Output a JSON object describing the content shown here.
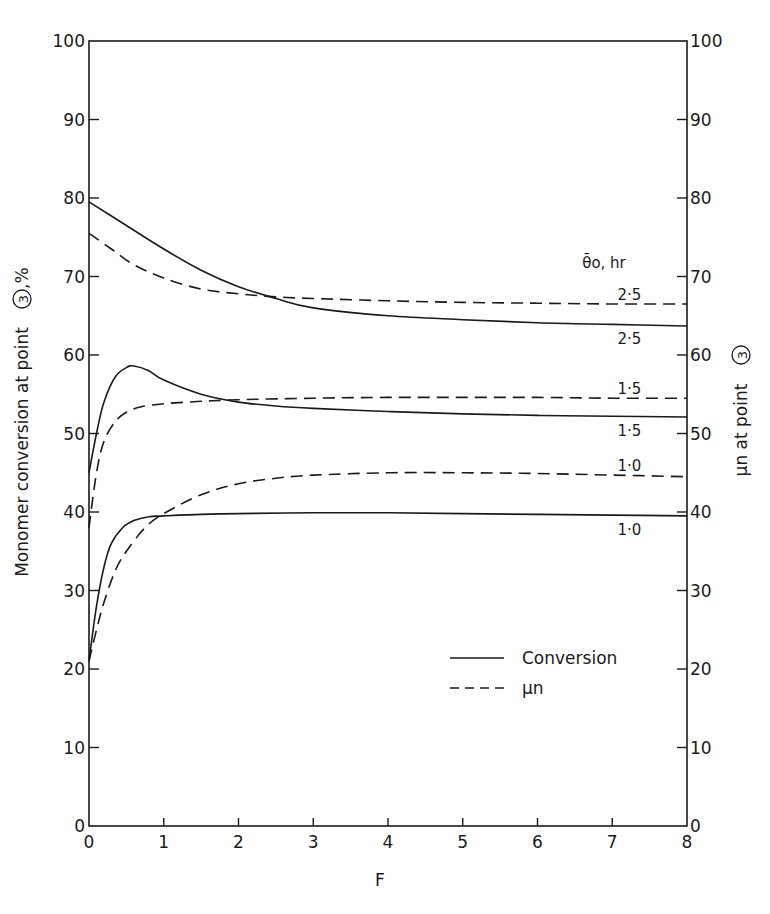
{
  "chart_data": {
    "type": "line",
    "title": "",
    "xlabel": "F",
    "ylabel_left": "Monomer conversion at point (3), %",
    "ylabel_right": "μn at point (3)",
    "xlim": [
      0,
      8
    ],
    "ylim_left": [
      0,
      100
    ],
    "ylim_right": [
      0,
      100
    ],
    "x_ticks": [
      "0",
      "1",
      "2",
      "3",
      "4",
      "5",
      "6",
      "7",
      "8"
    ],
    "y_ticks_left": [
      "0",
      "10",
      "20",
      "30",
      "40",
      "50",
      "60",
      "70",
      "80",
      "90",
      "100"
    ],
    "y_ticks_right": [
      "0",
      "10",
      "20",
      "30",
      "40",
      "50",
      "60",
      "70",
      "80",
      "90",
      "100"
    ],
    "grid": false,
    "legend": {
      "position": "lower-right",
      "entries": [
        {
          "label": "Conversion",
          "style": "solid"
        },
        {
          "label": "μn",
          "style": "dashed"
        }
      ]
    },
    "parameter_label": "θ̄o, hr",
    "series": [
      {
        "name": "Conversion, θo = 2.5 hr",
        "style": "solid",
        "param": "2.5",
        "x": [
          0,
          0.5,
          1,
          1.5,
          2,
          2.5,
          3,
          4,
          5,
          6,
          7,
          8
        ],
        "y": [
          79.5,
          76.5,
          73.5,
          70.8,
          68.7,
          67.2,
          66.0,
          65.0,
          64.5,
          64.1,
          63.9,
          63.7
        ]
      },
      {
        "name": "μn, θo = 2.5 hr",
        "style": "dashed",
        "param": "2.5",
        "x": [
          0,
          0.3,
          0.6,
          1,
          1.5,
          2,
          2.5,
          3,
          4,
          5,
          6,
          7,
          8
        ],
        "y": [
          75.5,
          73.5,
          71.5,
          69.8,
          68.4,
          67.8,
          67.4,
          67.2,
          66.9,
          66.7,
          66.6,
          66.5,
          66.5
        ]
      },
      {
        "name": "Conversion, θo = 1.5 hr",
        "style": "solid",
        "param": "1.5",
        "x": [
          0,
          0.1,
          0.2,
          0.35,
          0.5,
          0.6,
          0.8,
          1,
          1.5,
          2,
          2.5,
          3,
          4,
          5,
          6,
          7,
          8
        ],
        "y": [
          45,
          50,
          54,
          57.2,
          58.4,
          58.6,
          58.0,
          56.8,
          55.0,
          54.0,
          53.5,
          53.2,
          52.8,
          52.5,
          52.3,
          52.2,
          52.1
        ]
      },
      {
        "name": "μn, θo = 1.5 hr",
        "style": "dashed",
        "param": "1.5",
        "x": [
          0,
          0.1,
          0.2,
          0.35,
          0.5,
          0.7,
          1,
          1.5,
          2,
          3,
          4,
          5,
          6,
          7,
          8
        ],
        "y": [
          38,
          45,
          49,
          51.5,
          52.7,
          53.4,
          53.8,
          54.1,
          54.3,
          54.5,
          54.6,
          54.6,
          54.6,
          54.5,
          54.5
        ]
      },
      {
        "name": "Conversion, θo = 1.0 hr",
        "style": "solid",
        "param": "1.0",
        "x": [
          0,
          0.1,
          0.2,
          0.3,
          0.45,
          0.6,
          0.8,
          1,
          1.5,
          2,
          3,
          4,
          5,
          6,
          7,
          8
        ],
        "y": [
          21,
          28,
          33,
          36,
          38,
          38.9,
          39.4,
          39.5,
          39.7,
          39.8,
          39.9,
          39.9,
          39.8,
          39.7,
          39.6,
          39.5
        ]
      },
      {
        "name": "μn, θo = 1.0 hr",
        "style": "dashed",
        "param": "1.0",
        "x": [
          0,
          0.1,
          0.2,
          0.35,
          0.5,
          0.75,
          1,
          1.5,
          2,
          2.5,
          3,
          4,
          5,
          6,
          7,
          8
        ],
        "y": [
          21,
          25,
          28.5,
          32.5,
          35,
          38,
          39.8,
          42.2,
          43.6,
          44.3,
          44.7,
          45.0,
          45.0,
          44.9,
          44.7,
          44.5
        ]
      }
    ],
    "annotations": [
      {
        "text": "2·5",
        "attached_to": "μn, θo = 2.5 hr"
      },
      {
        "text": "2·5",
        "attached_to": "Conversion, θo = 2.5 hr"
      },
      {
        "text": "1·5",
        "attached_to": "μn, θo = 1.5 hr"
      },
      {
        "text": "1·5",
        "attached_to": "Conversion, θo = 1.5 hr"
      },
      {
        "text": "1·0",
        "attached_to": "μn, θo = 1.0 hr"
      },
      {
        "text": "1·0",
        "attached_to": "Conversion, θo = 1.0 hr"
      }
    ]
  },
  "labels": {
    "xlabel": "F",
    "ylabel_left_main": "Monomer conversion at point",
    "ylabel_left_circle": "3",
    "ylabel_left_suffix": ",%",
    "ylabel_right_main": "μn at point",
    "ylabel_right_circle": "3",
    "param_header": "θ̄o, hr",
    "legend_solid": "Conversion",
    "legend_dashed": "μn"
  }
}
